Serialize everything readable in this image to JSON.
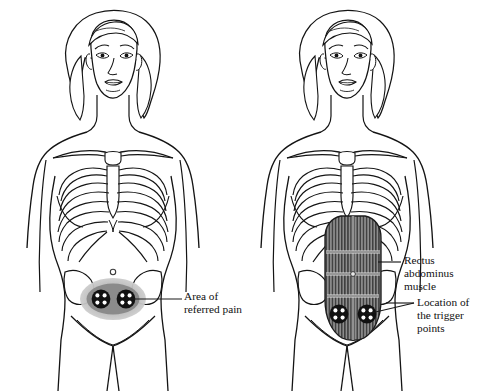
{
  "figure": {
    "type": "medical-line-illustration",
    "background_color": "#ffffff",
    "line_color": "#141414",
    "panels": [
      {
        "id": "left-panel",
        "name": "referred-pain-figure",
        "description": "Female torso line drawing, anterior view, showing ribcage, pelvis and shaded area of referred pain over the lower abdomen with two trigger point markers",
        "shows_muscle": false,
        "shows_referred_pain_area": true,
        "trigger_point_count": 2
      },
      {
        "id": "right-panel",
        "name": "rectus-abdominus-figure",
        "description": "Female torso line drawing, anterior view, showing ribcage, pelvis and the shaded rectus abdominus muscle with tendinous intersections and two trigger point markers at its lower end",
        "shows_muscle": true,
        "shows_referred_pain_area": false,
        "trigger_point_count": 2
      }
    ]
  },
  "labels": {
    "referred_pain": "Area of\nreferred pain",
    "rectus": "Rectus\nabdominus\nmuscle",
    "trigger": "Location of\nthe trigger\npoints"
  },
  "colors": {
    "outline": "#141414",
    "pain_halo": "#b9b9b9",
    "pain_core": "#8b8b8b",
    "muscle_fill": "#8d8d8d",
    "muscle_stripe": "#3a3a3a",
    "trigger_dark": "#111111",
    "trigger_dot": "#ffffff",
    "leader_line": "#1a1a1a"
  },
  "icons": {
    "trigger_point": "trigger-point-icon",
    "navel": "navel-icon"
  }
}
